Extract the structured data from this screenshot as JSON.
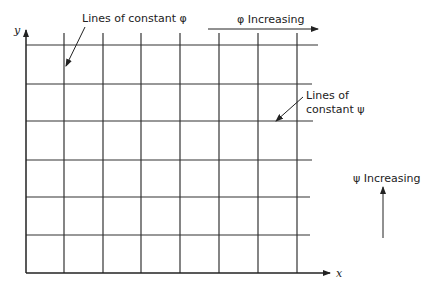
{
  "diagram": {
    "axes": {
      "x_label": "x",
      "y_label": "y"
    },
    "annotations": {
      "phi_lines": "Lines of constant φ",
      "psi_lines_line1": "Lines of",
      "psi_lines_line2": "constant ψ",
      "phi_increasing": "φ Increasing",
      "psi_increasing": "ψ Increasing"
    },
    "grid": {
      "vertical_lines_x": [
        64,
        103,
        141,
        180,
        219,
        258,
        297
      ],
      "horizontal_lines_y": [
        45,
        84,
        121,
        160,
        197,
        235
      ],
      "line_color": "#333333"
    }
  }
}
